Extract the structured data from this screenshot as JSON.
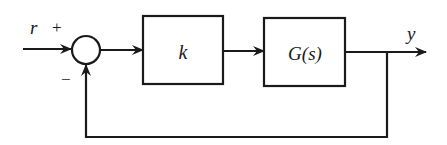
{
  "diagram": {
    "type": "feedback-control-block-diagram",
    "signals": {
      "input": "r",
      "output": "y"
    },
    "summing_junction": {
      "plus_sign": "+",
      "minus_sign": "−"
    },
    "blocks": [
      {
        "id": "controller",
        "label": "k"
      },
      {
        "id": "plant",
        "label": "G(s)"
      }
    ],
    "feedback": "unity negative feedback from y to summing junction",
    "colors": {
      "stroke": "#1a1a1a",
      "background": "#ffffff"
    }
  }
}
